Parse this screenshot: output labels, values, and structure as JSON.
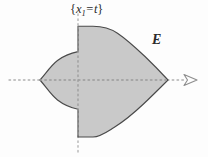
{
  "figure": {
    "kind": "mathematical-diagram",
    "background_color": "#fdfdfd",
    "labels": {
      "slice": {
        "open_brace": "{",
        "variable": "x",
        "subscript": "1",
        "equals": "=",
        "parameter": "t",
        "close_brace": "}",
        "full_text": "{x1 = t}"
      },
      "region": "E"
    },
    "axes": {
      "horizontal": {
        "name": "x1-axis",
        "style": "dotted",
        "color": "#b4b4b4",
        "y": 80,
        "x_start": 9,
        "x_end": 186,
        "arrowhead": true,
        "arrowhead_x": 196
      },
      "vertical": {
        "name": "slice-line",
        "style": "dotted",
        "color": "#b4b4b4",
        "x": 78,
        "y_start": 14,
        "y_end": 152,
        "arrowhead": false
      }
    },
    "region_shape": {
      "name": "E",
      "fill_color": "#c9c9c9",
      "stroke_color": "#4a4a4a",
      "stroke_width": 1.1,
      "left_cusp": [
        40,
        80
      ],
      "right_tip": [
        168,
        80
      ],
      "top_extent": 26,
      "bottom_extent": 138,
      "slice_x": 78,
      "path": "M 40 80 C 48 72 54 63 62 58 C 68 54 73 52 78 51 L 78 26 L 95 26 C 104 26 112 28 119 33 C 130 41 140 52 150 62 C 157 69 163 75 168 80 C 163 85 156 92 149 99 C 139 109 129 119 118 126 C 110 131 102 137 93 137 L 78 137 L 78 109 C 73 108 68 106 62 102 C 54 97 48 88 40 80 Z"
    }
  }
}
